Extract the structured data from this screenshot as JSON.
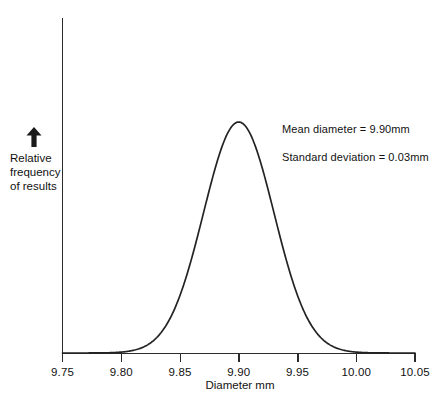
{
  "chart_data": {
    "type": "line",
    "title": "",
    "xlabel": "Diameter mm",
    "ylabel": "Relative frequency of results",
    "xlim": [
      9.75,
      10.05
    ],
    "ylim": [
      0,
      1
    ],
    "grid": false,
    "legend": "none",
    "distribution": {
      "kind": "normal",
      "mean": 9.9,
      "std_dev": 0.03,
      "peak_x": 9.9
    },
    "xticks": [
      "9.75",
      "9.80",
      "9.85",
      "9.90",
      "9.95",
      "10.00",
      "10.05"
    ],
    "xtick_values": [
      9.75,
      9.8,
      9.85,
      9.9,
      9.95,
      10.0,
      10.05
    ],
    "yticks": [],
    "x": [
      9.75,
      9.76,
      9.77,
      9.78,
      9.79,
      9.8,
      9.81,
      9.82,
      9.83,
      9.84,
      9.85,
      9.86,
      9.87,
      9.88,
      9.89,
      9.9,
      9.91,
      9.92,
      9.93,
      9.94,
      9.95,
      9.96,
      9.97,
      9.98,
      9.99,
      10.0,
      10.01,
      10.02,
      10.03,
      10.04,
      10.05
    ],
    "values": [
      0.0,
      0.0,
      0.0,
      0.0001,
      0.0004,
      0.0015,
      0.0051,
      0.0155,
      0.0409,
      0.0948,
      0.1919,
      0.3388,
      0.5273,
      0.7298,
      0.8948,
      1.0,
      0.8948,
      0.7298,
      0.5273,
      0.3388,
      0.1919,
      0.0948,
      0.0409,
      0.0155,
      0.0051,
      0.0015,
      0.0004,
      0.0001,
      0.0,
      0.0,
      0.0
    ],
    "annotations": [
      "Mean diameter  =  9.90mm",
      "Standard deviation  =  0.03mm"
    ],
    "colors": {
      "curve": "#232323",
      "axis": "#2b2b2b",
      "background": "#ffffff",
      "text": "#111111"
    }
  },
  "axes": {
    "ylabel_lines": [
      "Relative",
      "frequency",
      "of results"
    ],
    "xlabel": "Diameter mm",
    "y_arrow_name": "up-arrow-icon"
  },
  "annotations": {
    "mean": "Mean diameter  =  9.90mm",
    "std_dev": "Standard deviation  =  0.03mm"
  }
}
